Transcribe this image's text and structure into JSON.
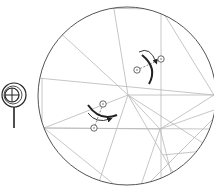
{
  "diagram": {
    "type": "origami-crease-pattern",
    "colors": {
      "crease": "#b8b8b8",
      "outline": "#555555",
      "symbol": "#222222",
      "background": "#ffffff"
    },
    "paper": {
      "shape": "circle",
      "cx": 127,
      "cy": 96,
      "r": 89
    },
    "creases": [
      [
        54,
        27,
        128,
        95
      ],
      [
        113,
        3,
        128,
        95
      ],
      [
        161,
        9,
        161,
        188
      ],
      [
        161,
        9,
        214,
        95
      ],
      [
        38,
        78,
        214,
        95
      ],
      [
        79,
        8,
        161,
        9
      ],
      [
        128,
        95,
        214,
        95
      ],
      [
        128,
        95,
        160,
        129
      ],
      [
        128,
        95,
        182,
        188
      ],
      [
        128,
        95,
        97,
        188
      ],
      [
        128,
        95,
        44,
        128
      ],
      [
        44,
        128,
        160,
        129
      ],
      [
        44,
        128,
        214,
        129
      ],
      [
        44,
        128,
        116,
        186
      ],
      [
        160,
        129,
        214,
        95
      ],
      [
        160,
        129,
        214,
        110
      ],
      [
        160,
        129,
        140,
        188
      ],
      [
        160,
        129,
        175,
        188
      ],
      [
        146,
        186,
        214,
        118
      ],
      [
        163,
        155,
        214,
        150
      ],
      [
        128,
        95,
        214,
        150
      ],
      [
        42,
        78,
        42,
        128
      ]
    ],
    "symbols": [
      {
        "name": "swivel-fold-upper",
        "pivot_a": [
          137,
          70
        ],
        "pivot_b": [
          161,
          59
        ],
        "arc": "M142 55 Q158 68 149 84",
        "arrow": "M139 52 Q150 46 156 62"
      },
      {
        "name": "swivel-fold-lower",
        "pivot_a": [
          103,
          104
        ],
        "pivot_b": [
          94,
          128
        ],
        "arc": "M88 105 Q100 122 117 115",
        "arrow": "M88 113 Q96 124 110 119"
      }
    ],
    "side_icon": {
      "name": "repeat-behind-lens",
      "cx": 14,
      "cy": 95,
      "r_outer": 12,
      "r_inner": 7,
      "handle": [
        14,
        107,
        14,
        128
      ]
    }
  }
}
